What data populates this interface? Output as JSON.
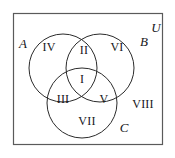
{
  "figure": {
    "universe_border_color": "#5a5a5a",
    "circle_stroke_color": "#2b2b2b",
    "background_color": "#ffffff",
    "text_color": "#16161a"
  },
  "universe": {
    "label": "U",
    "rect": {
      "x": 13,
      "y": 13,
      "width": 150,
      "height": 132
    },
    "label_pos": {
      "x": 156,
      "y": 27
    }
  },
  "sets": [
    {
      "name": "set-a",
      "label": "A",
      "cx": 63,
      "cy": 68,
      "r": 34,
      "label_pos": {
        "x": 23,
        "y": 43
      }
    },
    {
      "name": "set-b",
      "label": "B",
      "cx": 100,
      "cy": 68,
      "r": 34,
      "label_pos": {
        "x": 144,
        "y": 41
      }
    },
    {
      "name": "set-c",
      "label": "C",
      "cx": 82,
      "cy": 103,
      "r": 35,
      "label_pos": {
        "x": 124,
        "y": 127
      }
    }
  ],
  "regions": [
    {
      "name": "region-i",
      "label": "I",
      "x": 82,
      "y": 79,
      "description": "A and B and C"
    },
    {
      "name": "region-ii",
      "label": "II",
      "x": 84,
      "y": 50,
      "description": "A and B, not C"
    },
    {
      "name": "region-iii",
      "label": "III",
      "x": 63,
      "y": 99,
      "description": "A and C, not B"
    },
    {
      "name": "region-iv",
      "label": "IV",
      "x": 49,
      "y": 47,
      "description": "A only"
    },
    {
      "name": "region-v",
      "label": "V",
      "x": 104,
      "y": 99,
      "description": "B and C, not A"
    },
    {
      "name": "region-vi",
      "label": "VI",
      "x": 117,
      "y": 47,
      "description": "B only"
    },
    {
      "name": "region-vii",
      "label": "VII",
      "x": 87,
      "y": 121,
      "description": "C only"
    },
    {
      "name": "region-viii",
      "label": "VIII",
      "x": 143,
      "y": 104,
      "description": "outside A, B and C"
    }
  ]
}
